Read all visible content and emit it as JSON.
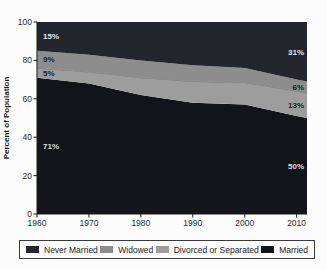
{
  "chart_data": {
    "type": "area",
    "stacked": true,
    "title": "",
    "xlabel": "",
    "ylabel": "Percent of Population",
    "xlim": [
      1960,
      2012
    ],
    "ylim": [
      0,
      100
    ],
    "x": [
      1960,
      1970,
      1980,
      1990,
      2000,
      2010,
      2012
    ],
    "x_ticks": [
      "1960",
      "1970",
      "1980",
      "1990",
      "2000",
      "2010"
    ],
    "x_tick_values": [
      1960,
      1970,
      1980,
      1990,
      2000,
      2010
    ],
    "y_ticks": [
      "0",
      "20",
      "40",
      "60",
      "80",
      "100"
    ],
    "y_tick_values": [
      0,
      20,
      40,
      60,
      80,
      100
    ],
    "grid": false,
    "series": [
      {
        "name": "Married",
        "values": [
          71,
          68,
          62,
          58,
          57,
          51,
          50
        ],
        "color": "#131419",
        "label_color": "#dedede",
        "label_left": "71%",
        "label_right": "50%"
      },
      {
        "name": "Divorced or Separated",
        "values": [
          5,
          6,
          9,
          11,
          11.5,
          13,
          13
        ],
        "color": "#9d9d9d",
        "label_color": "#1d1d1d",
        "label_left": "5%",
        "label_right": "13%",
        "top_stroke": "#6f6f6f"
      },
      {
        "name": "Widowed",
        "values": [
          9,
          9,
          9,
          8.5,
          7.5,
          6,
          6
        ],
        "color": "#8d8d8d",
        "label_color": "#1d1d1d",
        "label_left": "9%",
        "label_right": "6%"
      },
      {
        "name": "Never Married",
        "values": [
          15,
          17,
          20,
          22.5,
          24,
          30,
          31
        ],
        "color": "#24262e",
        "label_color": "#e8e8e8",
        "label_left": "15%",
        "label_right": "31%"
      }
    ],
    "legend": {
      "position": "bottom",
      "entries": [
        "Never Married",
        "Widowed",
        "Divorced or Separated",
        "Married"
      ]
    }
  },
  "colors": {
    "background": "#fcfcfc",
    "axis": "#1a1a1a",
    "tick_label": "#2b2b2b",
    "legend_border": "#3a3a3a",
    "legend_text": "#222222"
  }
}
